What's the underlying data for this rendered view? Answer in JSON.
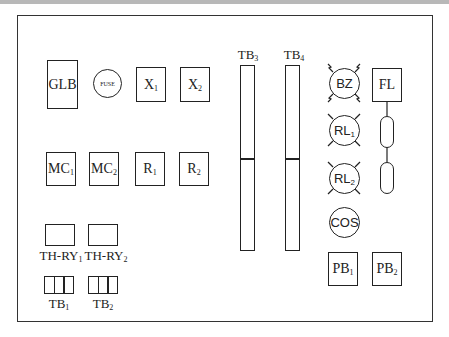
{
  "diagram": {
    "colors": {
      "line": "#222222",
      "background": "#ffffff",
      "top_band": "#b8b8b8"
    },
    "components": {
      "glb": {
        "label": "GLB"
      },
      "fuse": {
        "label": "FUSE"
      },
      "x1": {
        "base": "X",
        "sub": "1"
      },
      "x2": {
        "base": "X",
        "sub": "2"
      },
      "mc1": {
        "base": "MC",
        "sub": "1"
      },
      "mc2": {
        "base": "MC",
        "sub": "2"
      },
      "r1": {
        "base": "R",
        "sub": "1"
      },
      "r2": {
        "base": "R",
        "sub": "2"
      },
      "thry1": {
        "base": "TH-RY",
        "sub": "1"
      },
      "thry2": {
        "base": "TH-RY",
        "sub": "2"
      },
      "tb1": {
        "base": "TB",
        "sub": "1"
      },
      "tb2": {
        "base": "TB",
        "sub": "2"
      },
      "tb3": {
        "base": "TB",
        "sub": "3"
      },
      "tb4": {
        "base": "TB",
        "sub": "4"
      },
      "bz": {
        "label": "BZ"
      },
      "rl1": {
        "base": "RL",
        "sub": "1"
      },
      "rl2": {
        "base": "RL",
        "sub": "2"
      },
      "cos": {
        "label": "COS"
      },
      "fl": {
        "label": "FL"
      },
      "pb1": {
        "base": "PB",
        "sub": "1"
      },
      "pb2": {
        "base": "PB",
        "sub": "2"
      }
    }
  }
}
